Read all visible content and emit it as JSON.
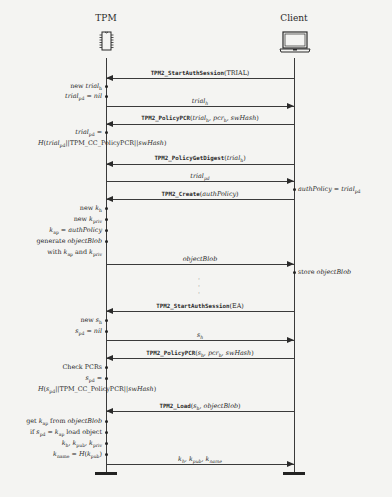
{
  "actors": {
    "tpm": {
      "label": "TPM",
      "icon": "chip-icon"
    },
    "client": {
      "label": "Client",
      "icon": "laptop-icon"
    }
  },
  "messages": [
    {
      "id": 1,
      "direction": "client-to-tpm",
      "y": 77,
      "cmd": "TPM2_StartAuthSession",
      "args": "(TRIAL)"
    },
    {
      "id": 2,
      "direction": "tpm-to-client",
      "y": 106,
      "label": "trial_h"
    },
    {
      "id": 3,
      "direction": "client-to-tpm",
      "y": 123,
      "cmd": "TPM2_PolicyPCR",
      "args": "(trial_h, pcr_h, swHash)"
    },
    {
      "id": 4,
      "direction": "client-to-tpm",
      "y": 163,
      "cmd": "TPM2_PolicyGetDigest",
      "args": "(trial_h)"
    },
    {
      "id": 5,
      "direction": "tpm-to-client",
      "y": 181,
      "label": "trial_pd"
    },
    {
      "id": 6,
      "direction": "client-to-tpm",
      "y": 199,
      "cmd": "TPM2_Create",
      "args": "(authPolicy)"
    },
    {
      "id": 7,
      "direction": "tpm-to-client",
      "y": 264,
      "label": "objectBlob"
    },
    {
      "id": 8,
      "direction": "client-to-tpm",
      "y": 311,
      "cmd": "TPM2_StartAuthSession",
      "args": "(EA)"
    },
    {
      "id": 9,
      "direction": "tpm-to-client",
      "y": 340,
      "label": "s_h"
    },
    {
      "id": 10,
      "direction": "client-to-tpm",
      "y": 358,
      "cmd": "TPM2_PolicyPCR",
      "args": "(s_h, pcr_h, swHash)"
    },
    {
      "id": 11,
      "direction": "client-to-tpm",
      "y": 411,
      "cmd": "TPM2_Load",
      "args": "(s_h, objectBlob)"
    },
    {
      "id": 12,
      "direction": "tpm-to-client",
      "y": 464,
      "label": "k_h, k_pub, k_name"
    }
  ],
  "tpm_notes": [
    "new trial_h",
    "trial_pd = nil",
    "trial_pd =",
    "H(trial_pd||TPM_CC_PolicyPCR||swHash)",
    "new k_h",
    "new k_priv",
    "k_ap = authPolicy",
    "generate objectBlob",
    "with k_ap and k_priv",
    "new s_h",
    "s_pd = nil",
    "Check PCRs",
    "s_pd =",
    "H(s_pd||TPM_CC_PolicyPCR||swHash)",
    "get k_ap from objectBlob",
    "if s_pd = k_ap load object",
    "k_h, k_pub, k_priv",
    "k_name = H(k_pub)"
  ],
  "client_notes": [
    "authPolicy = trial_pd",
    "store objectBlob"
  ],
  "ellipsis": "⋮"
}
